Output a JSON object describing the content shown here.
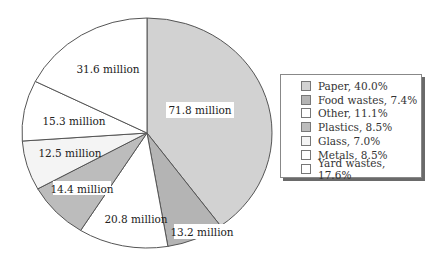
{
  "chart_data": {
    "type": "pie",
    "title": "",
    "start_angle_deg": 0,
    "direction": "clockwise",
    "slices": [
      {
        "category": "Paper",
        "value_label": "71.8 million",
        "value": 71.8,
        "percent": 40.0,
        "color": "#d2d2d2"
      },
      {
        "category": "Food wastes",
        "value_label": "13.2 million",
        "value": 13.2,
        "percent": 7.4,
        "color": "#b4b4b4"
      },
      {
        "category": "Other",
        "value_label": "20.8 million",
        "value": 20.8,
        "percent": 11.1,
        "color": "#ffffff"
      },
      {
        "category": "Plastics",
        "value_label": "14.4 million",
        "value": 14.4,
        "percent": 8.5,
        "color": "#bcbcbc"
      },
      {
        "category": "Glass",
        "value_label": "12.5 million",
        "value": 12.5,
        "percent": 7.0,
        "color": "#f4f4f4"
      },
      {
        "category": "Metals",
        "value_label": "15.3 million",
        "value": 15.3,
        "percent": 8.5,
        "color": "#ffffff"
      },
      {
        "category": "Yard wastes",
        "value_label": "31.6 million",
        "value": 31.6,
        "percent": 17.6,
        "color": "#ffffff"
      }
    ],
    "legend": {
      "position": "right",
      "entries": [
        {
          "label": "Paper, 40.0%",
          "color": "#d2d2d2"
        },
        {
          "label": "Food wastes, 7.4%",
          "color": "#b4b4b4"
        },
        {
          "label": "Other, 11.1%",
          "color": "#ffffff"
        },
        {
          "label": "Plastics, 8.5%",
          "color": "#bcbcbc"
        },
        {
          "label": "Glass, 7.0%",
          "color": "#f4f4f4"
        },
        {
          "label": "Metals, 8.5%",
          "color": "#ffffff"
        },
        {
          "label": "Yard wastes, 17.6%",
          "color": "#ffffff"
        }
      ]
    }
  },
  "labels": {
    "paper": "71.8 million",
    "food": "13.2 million",
    "other": "20.8 million",
    "plastics": "14.4 million",
    "glass": "12.5 million",
    "metals": "15.3 million",
    "yard": "31.6 million"
  },
  "legend": {
    "items": [
      {
        "label": "Paper, 40.0%"
      },
      {
        "label": "Food wastes, 7.4%"
      },
      {
        "label": "Other, 11.1%"
      },
      {
        "label": "Plastics, 8.5%"
      },
      {
        "label": "Glass, 7.0%"
      },
      {
        "label": "Metals, 8.5%"
      },
      {
        "label": "Yard wastes, 17.6%"
      }
    ]
  }
}
